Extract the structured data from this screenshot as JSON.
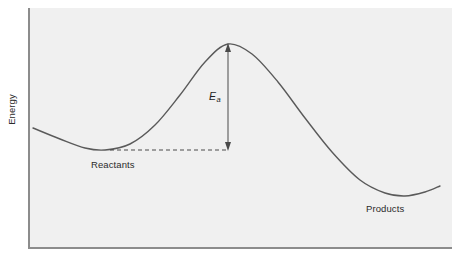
{
  "figure": {
    "background_color": "#ffffff",
    "plot_background_color": "#f0f0f0",
    "axis_color": "#8c8c8c",
    "curve_color": "#5a5a5a",
    "annotation_color": "#4a4a4a"
  },
  "axes": {
    "y_label": "Energy",
    "x_label": "",
    "tick_labels": []
  },
  "labels": {
    "reactants": "Reactants",
    "products": "Products",
    "activation_energy_symbol": "E",
    "activation_energy_subscript": "a"
  },
  "chart_data": {
    "type": "line",
    "title": "",
    "xlabel": "",
    "ylabel": "Energy",
    "grid": false,
    "legend": null,
    "axis_ticks": {
      "x": [],
      "y": []
    },
    "series": [
      {
        "name": "Reaction energy profile",
        "points": [
          {
            "x": 33,
            "y": 128
          },
          {
            "x": 60,
            "y": 139
          },
          {
            "x": 85,
            "y": 148
          },
          {
            "x": 105,
            "y": 150
          },
          {
            "x": 130,
            "y": 144
          },
          {
            "x": 155,
            "y": 125
          },
          {
            "x": 180,
            "y": 95
          },
          {
            "x": 205,
            "y": 62
          },
          {
            "x": 228,
            "y": 44
          },
          {
            "x": 252,
            "y": 54
          },
          {
            "x": 278,
            "y": 82
          },
          {
            "x": 305,
            "y": 118
          },
          {
            "x": 332,
            "y": 152
          },
          {
            "x": 360,
            "y": 180
          },
          {
            "x": 385,
            "y": 193
          },
          {
            "x": 405,
            "y": 196
          },
          {
            "x": 425,
            "y": 192
          },
          {
            "x": 440,
            "y": 186
          }
        ]
      }
    ],
    "annotations": [
      {
        "kind": "double-headed-arrow",
        "label": "Ea",
        "x": 228,
        "y_top": 44,
        "y_bottom": 150,
        "meaning": "activation energy"
      },
      {
        "kind": "dashed-line",
        "x_start": 110,
        "x_end": 228,
        "y": 150,
        "meaning": "reactant energy level"
      },
      {
        "kind": "text",
        "label": "Reactants",
        "x": 91,
        "y": 159
      },
      {
        "kind": "text",
        "label": "Products",
        "x": 366,
        "y": 203
      }
    ],
    "features": {
      "reactant_minimum": {
        "x": 105,
        "y": 150
      },
      "transition_state_peak": {
        "x": 228,
        "y": 44
      },
      "product_minimum": {
        "x": 405,
        "y": 196
      },
      "note": "y pixel values increase downward; lower pixel y = higher energy"
    }
  }
}
